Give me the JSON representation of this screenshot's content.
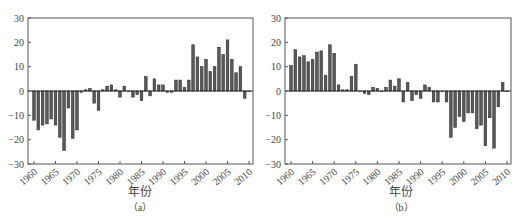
{
  "chart_data": [
    {
      "type": "bar",
      "title": "",
      "caption": "（a）",
      "xlabel": "年份",
      "ylabel": "",
      "ylim": [
        -30,
        30
      ],
      "yticks": [
        30,
        20,
        10,
        0,
        -10,
        -20,
        -30
      ],
      "xtick_labels": [
        "1960",
        "1965",
        "1970",
        "1975",
        "1980",
        "1985",
        "1990",
        "1995",
        "2000",
        "2005",
        "2010"
      ],
      "grid": false,
      "x": [
        1960,
        1961,
        1962,
        1963,
        1964,
        1965,
        1966,
        1967,
        1968,
        1969,
        1970,
        1971,
        1972,
        1973,
        1974,
        1975,
        1976,
        1977,
        1978,
        1979,
        1980,
        1981,
        1982,
        1983,
        1984,
        1985,
        1986,
        1987,
        1988,
        1989,
        1990,
        1991,
        1992,
        1993,
        1994,
        1995,
        1996,
        1997,
        1998,
        1999,
        2000,
        2001,
        2002,
        2003,
        2004,
        2005,
        2006,
        2007,
        2008,
        2009,
        2010
      ],
      "values": [
        -12,
        -16,
        -14,
        -13.5,
        -11.5,
        -14,
        -19,
        -24.5,
        -7,
        -19.5,
        -16,
        -0.5,
        0.5,
        1,
        -5,
        -8,
        0.5,
        2,
        2.5,
        0.5,
        -2.5,
        2,
        0,
        -2.5,
        -1.5,
        -4,
        6,
        -2,
        5,
        2.5,
        2.5,
        -0.5,
        -0.5,
        4.5,
        4.5,
        1.5,
        4.5,
        19,
        14,
        10,
        13,
        8,
        10,
        18,
        15,
        21,
        13,
        7.5,
        10,
        -3,
        0
      ]
    },
    {
      "type": "bar",
      "title": "",
      "caption": "（b）",
      "xlabel": "年份",
      "ylabel": "",
      "ylim": [
        -30,
        30
      ],
      "yticks": [
        30,
        20,
        10,
        0,
        -10,
        -20,
        -30
      ],
      "xtick_labels": [
        "1960",
        "1965",
        "1970",
        "1975",
        "1980",
        "1985",
        "1990",
        "1995",
        "2000",
        "2005",
        "2010"
      ],
      "grid": false,
      "x": [
        1960,
        1961,
        1962,
        1963,
        1964,
        1965,
        1966,
        1967,
        1968,
        1969,
        1970,
        1971,
        1972,
        1973,
        1974,
        1975,
        1976,
        1977,
        1978,
        1979,
        1980,
        1981,
        1982,
        1983,
        1984,
        1985,
        1986,
        1987,
        1988,
        1989,
        1990,
        1991,
        1992,
        1993,
        1994,
        1995,
        1996,
        1997,
        1998,
        1999,
        2000,
        2001,
        2002,
        2003,
        2004,
        2005,
        2006,
        2007,
        2008,
        2009,
        2010
      ],
      "values": [
        10.5,
        17,
        14,
        14.5,
        12,
        13,
        16,
        16.5,
        6.5,
        19,
        15.5,
        2.5,
        0.5,
        0.5,
        6,
        11,
        0,
        -1,
        -1.5,
        1.5,
        1,
        0,
        1.5,
        4.5,
        2,
        5,
        -4.5,
        3.5,
        -4,
        -1.5,
        -3,
        2.5,
        1.5,
        -4.5,
        -4.5,
        0,
        -4.5,
        -19,
        -15,
        -10.5,
        -12.5,
        -9,
        -9,
        -15.5,
        -14,
        -22.5,
        -11,
        -23.5,
        -6.5,
        3.5,
        0
      ]
    }
  ],
  "colors": {
    "bar_fill": "#5a5a5a",
    "bar_edge": "#222222",
    "axis": "#555555",
    "text": "#444444"
  }
}
